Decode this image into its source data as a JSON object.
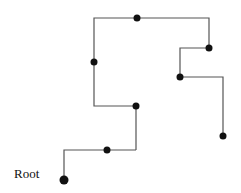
{
  "diagram": {
    "type": "rectilinear-tree",
    "root_label": "Root",
    "colors": {
      "edge": "#555555",
      "node": "#111111",
      "label": "#111111"
    },
    "edges": [
      {
        "id": "e1",
        "points": "64,180 64,150 136,150"
      },
      {
        "id": "e2",
        "points": "136,150 136,106 94,106 94,18 209,18 209,48"
      },
      {
        "id": "e3",
        "points": "209,48 180,48 180,77"
      },
      {
        "id": "e4",
        "points": "180,77 223,77 223,136"
      }
    ],
    "nodes": [
      {
        "id": "root",
        "x": 64,
        "y": 180,
        "r": 4.5
      },
      {
        "id": "n1",
        "x": 107,
        "y": 150,
        "r": 3.5
      },
      {
        "id": "n2",
        "x": 136,
        "y": 106,
        "r": 3.5
      },
      {
        "id": "n3",
        "x": 94,
        "y": 62,
        "r": 3.5
      },
      {
        "id": "n4",
        "x": 137,
        "y": 18,
        "r": 3.5
      },
      {
        "id": "n5",
        "x": 209,
        "y": 48,
        "r": 3.5
      },
      {
        "id": "n6",
        "x": 180,
        "y": 77,
        "r": 3.5
      },
      {
        "id": "n7",
        "x": 223,
        "y": 136,
        "r": 3.5
      }
    ]
  }
}
